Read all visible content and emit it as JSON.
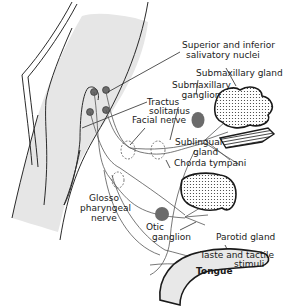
{
  "diagram": {
    "type": "anatomical-schematic",
    "colors": {
      "brainstem_fill": "#e6e6e6",
      "tongue_fill": "#e8e8e8",
      "ganglion_fill": "#6b6b6b",
      "line": "#2a2a2a",
      "nerve": "#555555"
    },
    "labels": {
      "salivatory_nuclei_1": "Superior and inferior",
      "salivatory_nuclei_2": "salivatory nuclei",
      "submaxillary_gland": "Submaxillary gland",
      "submaxillary_ganglion_1": "Submaxillary",
      "submaxillary_ganglion_2": "ganglion",
      "tractus_1": "Tractus",
      "tractus_2": "solitarius",
      "facial_nerve": "Facial nerve",
      "sublingual_1": "Sublingual",
      "sublingual_2": "gland",
      "chorda_tympani": "Chorda tympani",
      "glosso_1": "Glosso",
      "glosso_2": "pharyngeal",
      "glosso_3": "nerve",
      "otic_1": "Otic",
      "otic_2": "ganglion",
      "parotid_gland": "Parotid gland",
      "taste_1": "Taste and tactile",
      "taste_2": "stimuli",
      "tongue": "Tongue"
    }
  }
}
